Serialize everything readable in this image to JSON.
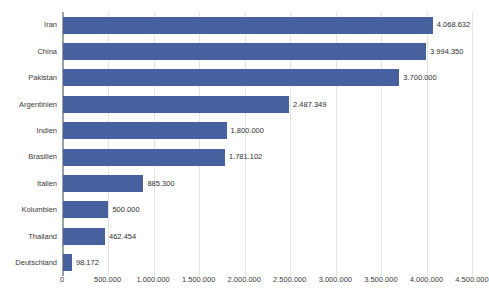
{
  "chart_data": {
    "type": "bar",
    "orientation": "horizontal",
    "title": "",
    "subtitle": "",
    "xlabel": "",
    "ylabel": "",
    "xlim": [
      0,
      4500000
    ],
    "grid": true,
    "legend": null,
    "bar_color": "#47619e",
    "axis_color": "#9aa0a6",
    "grid_color": "#e2e4ea",
    "number_format": "de-DE dot thousands separator",
    "categories": [
      "Iran",
      "China",
      "Pakistan",
      "Argentinien",
      "Indien",
      "Brasilien",
      "Italien",
      "Kolumbien",
      "Thailand",
      "Deutschland"
    ],
    "values": [
      4068632,
      3994350,
      3700000,
      2487349,
      1800000,
      1781102,
      885300,
      500000,
      462454,
      98172
    ],
    "value_labels": [
      "4.068.632",
      "3.994.350",
      "3.700.000",
      "2.487.349",
      "1.800.000",
      "1.781.102",
      "885.300",
      "500.000",
      "462.454",
      "98.172"
    ],
    "xticks": [
      0,
      500000,
      1000000,
      1500000,
      2000000,
      2500000,
      3000000,
      3500000,
      4000000,
      4500000
    ],
    "xtick_labels": [
      "0",
      "500.000",
      "1.000.000",
      "1.500.000",
      "2.000.000",
      "2.500.000",
      "3.000.000",
      "3.500.000",
      "4.000.000",
      "4.500.000"
    ]
  }
}
